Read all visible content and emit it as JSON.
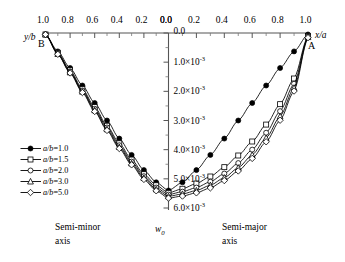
{
  "chart_data": {
    "type": "line",
    "title": "",
    "axes": {
      "top_left": {
        "label": "y/b",
        "ticks": [
          "1.0",
          "0.8",
          "0.6",
          "0.4",
          "0.2",
          "0.0"
        ],
        "values": [
          1.0,
          0.8,
          0.6,
          0.4,
          0.2,
          0.0
        ],
        "direction": "decreasing",
        "minor_ticks_per_interval": 1
      },
      "top_right": {
        "label": "x/a",
        "ticks": [
          "0.0",
          "0.2",
          "0.4",
          "0.6",
          "0.8",
          "1.0"
        ],
        "values": [
          0.0,
          0.2,
          0.4,
          0.6,
          0.8,
          1.0
        ],
        "direction": "increasing",
        "minor_ticks_per_interval": 1
      },
      "y": {
        "label": "w0",
        "ticks": [
          "0.0",
          "1.0×10",
          "2.0×10",
          "3.0×10",
          "4.0×10",
          "5.0×10",
          "6.0×10"
        ],
        "exponent": "-3",
        "values": [
          0.0,
          0.001,
          0.002,
          0.003,
          0.004,
          0.005,
          0.006
        ],
        "ylim": [
          0.0,
          0.006
        ],
        "direction": "inverted",
        "minor_ticks_per_interval": 1
      }
    },
    "grid": false,
    "legend": {
      "position": "lower-left",
      "entries": [
        {
          "label": "a/b=1.0",
          "prefix": "a/b",
          "value": "1.0",
          "marker": "filled-circle",
          "filled": true
        },
        {
          "label": "a/b=1.5",
          "prefix": "a/b",
          "value": "1.5",
          "marker": "open-square",
          "filled": false
        },
        {
          "label": "a/b=2.0",
          "prefix": "a/b",
          "value": "2.0",
          "marker": "open-circle",
          "filled": false
        },
        {
          "label": "a/b=3.0",
          "prefix": "a/b",
          "value": "3.0",
          "marker": "open-triangle",
          "filled": false
        },
        {
          "label": "a/b=5.0",
          "prefix": "a/b",
          "value": "5.0",
          "marker": "open-diamond",
          "filled": false
        }
      ]
    },
    "annotations": [
      {
        "name": "point-label-B",
        "text": "B",
        "x": 0.97,
        "side": "left"
      },
      {
        "name": "point-label-A",
        "text": "A",
        "x": 0.97,
        "side": "right"
      },
      {
        "name": "axis-caption-left",
        "text": "Semi-minor",
        "text2": "axis"
      },
      {
        "name": "axis-caption-right",
        "text": "Semi-major",
        "text2": "axis"
      },
      {
        "name": "deflection-symbol",
        "text": "w",
        "subscript": "0"
      }
    ],
    "series": [
      {
        "name": "a/b=1.0",
        "marker": "filled-circle",
        "left_x": [
          1.0,
          0.9,
          0.8,
          0.7,
          0.6,
          0.5,
          0.4,
          0.3,
          0.2,
          0.1,
          0.0
        ],
        "left_y": [
          5e-05,
          0.00063,
          0.0012,
          0.0018,
          0.0024,
          0.003,
          0.00362,
          0.00418,
          0.0047,
          0.00512,
          0.0054
        ],
        "right_x": [
          0.0,
          0.1,
          0.2,
          0.3,
          0.4,
          0.5,
          0.6,
          0.7,
          0.8,
          0.9,
          1.0
        ],
        "right_y": [
          0.0054,
          0.00512,
          0.0047,
          0.00418,
          0.00362,
          0.003,
          0.0024,
          0.0018,
          0.0012,
          0.00063,
          5e-05
        ]
      },
      {
        "name": "a/b=1.5",
        "marker": "open-square",
        "left_x": [
          1.0,
          0.9,
          0.8,
          0.7,
          0.6,
          0.5,
          0.4,
          0.3,
          0.2,
          0.1,
          0.0
        ],
        "left_y": [
          5e-05,
          0.00068,
          0.00128,
          0.00192,
          0.00254,
          0.00318,
          0.00378,
          0.00434,
          0.00484,
          0.00522,
          0.00548
        ],
        "right_x": [
          0.0,
          0.1,
          0.2,
          0.3,
          0.4,
          0.5,
          0.6,
          0.7,
          0.8,
          0.9,
          1.0
        ],
        "right_y": [
          0.00548,
          0.00534,
          0.00516,
          0.00492,
          0.0046,
          0.0042,
          0.00372,
          0.00314,
          0.00244,
          0.00156,
          0.0001
        ]
      },
      {
        "name": "a/b=2.0",
        "marker": "open-circle",
        "left_x": [
          1.0,
          0.9,
          0.8,
          0.7,
          0.6,
          0.5,
          0.4,
          0.3,
          0.2,
          0.1,
          0.0
        ],
        "left_y": [
          5e-05,
          0.0007,
          0.00132,
          0.00197,
          0.0026,
          0.00324,
          0.00385,
          0.00441,
          0.00491,
          0.0053,
          0.00554
        ],
        "right_x": [
          0.0,
          0.1,
          0.2,
          0.3,
          0.4,
          0.5,
          0.6,
          0.7,
          0.8,
          0.9,
          1.0
        ],
        "right_y": [
          0.00554,
          0.00544,
          0.0053,
          0.0051,
          0.00482,
          0.00446,
          0.004,
          0.00342,
          0.00268,
          0.00174,
          0.00012
        ]
      },
      {
        "name": "a/b=3.0",
        "marker": "open-triangle",
        "left_x": [
          1.0,
          0.9,
          0.8,
          0.7,
          0.6,
          0.5,
          0.4,
          0.3,
          0.2,
          0.1,
          0.0
        ],
        "left_y": [
          5e-05,
          0.00072,
          0.00135,
          0.00201,
          0.00265,
          0.0033,
          0.00391,
          0.00447,
          0.00497,
          0.00536,
          0.0056
        ],
        "right_x": [
          0.0,
          0.1,
          0.2,
          0.3,
          0.4,
          0.5,
          0.6,
          0.7,
          0.8,
          0.9,
          1.0
        ],
        "right_y": [
          0.0056,
          0.00552,
          0.0054,
          0.00522,
          0.00496,
          0.00462,
          0.00418,
          0.0036,
          0.00286,
          0.00188,
          0.00014
        ]
      },
      {
        "name": "a/b=5.0",
        "marker": "open-diamond",
        "left_x": [
          1.0,
          0.9,
          0.8,
          0.7,
          0.6,
          0.5,
          0.4,
          0.3,
          0.2,
          0.1,
          0.0
        ],
        "left_y": [
          5e-05,
          0.00073,
          0.00137,
          0.00204,
          0.00269,
          0.00334,
          0.00396,
          0.00452,
          0.00502,
          0.00541,
          0.00566
        ],
        "right_x": [
          0.0,
          0.1,
          0.2,
          0.3,
          0.4,
          0.5,
          0.6,
          0.7,
          0.8,
          0.9,
          1.0
        ],
        "right_y": [
          0.00566,
          0.00559,
          0.00548,
          0.00531,
          0.00506,
          0.00473,
          0.0043,
          0.00373,
          0.00299,
          0.00199,
          0.00016
        ]
      }
    ]
  },
  "labels": {
    "y_axis_symbol": "w",
    "y_axis_symbol_sub": "0",
    "left_caption_1": "Semi-minor",
    "left_caption_2": "axis",
    "right_caption_1": "Semi-major",
    "right_caption_2": "axis",
    "point_A": "A",
    "point_B": "B",
    "left_axis_title": "y/b",
    "right_axis_title": "x/a"
  },
  "colors": {
    "line": "#000000",
    "background": "#ffffff",
    "marker_fill_open": "#ffffff"
  }
}
